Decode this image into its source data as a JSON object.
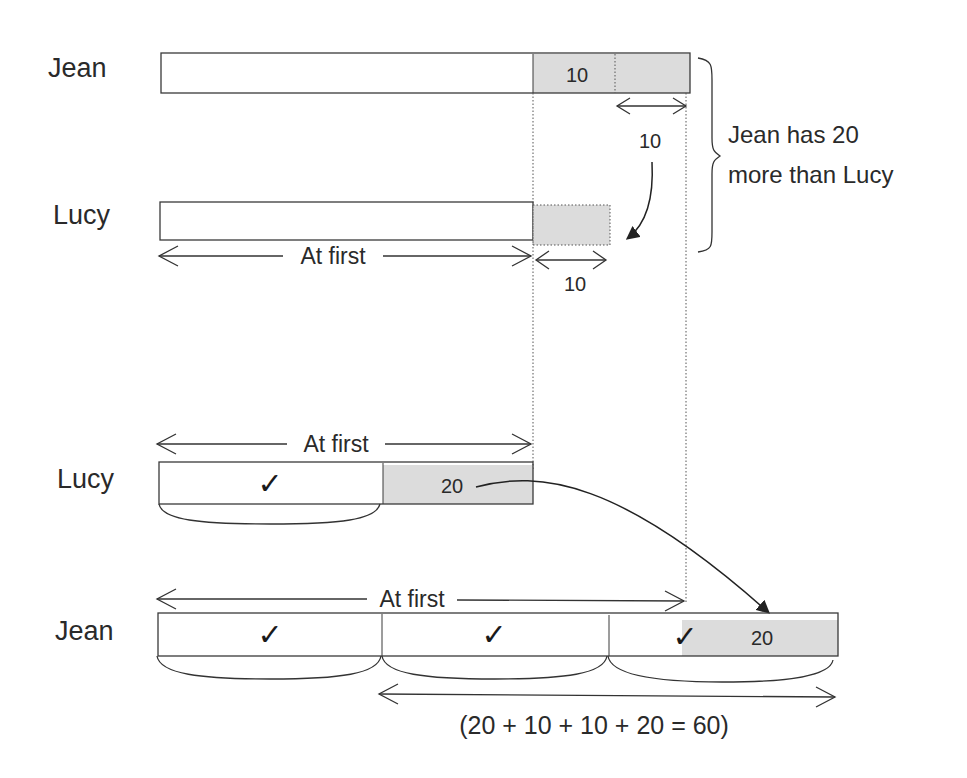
{
  "diagram": {
    "type": "bar-model",
    "colors": {
      "shade": "#dcdcdc",
      "stroke": "#3a3a3a",
      "text": "#2a2a2a"
    },
    "top_model": {
      "jean": {
        "label": "Jean",
        "shaded_part_label": "10",
        "transfer_amount_label": "10"
      },
      "lucy": {
        "label": "Lucy",
        "at_first_label": "At first",
        "added_part_label": "10"
      },
      "brace_note_line1": "Jean has 20",
      "brace_note_line2": "more than Lucy"
    },
    "bottom_model": {
      "lucy": {
        "label": "Lucy",
        "at_first_label": "At first",
        "unit_check": "✓",
        "extra_label": "20"
      },
      "jean": {
        "label": "Jean",
        "at_first_label": "At first",
        "unit_checks": [
          "✓",
          "✓",
          "✓"
        ],
        "extra_label": "20"
      },
      "equation": "(20 + 10 + 10 + 20 = 60)"
    }
  }
}
